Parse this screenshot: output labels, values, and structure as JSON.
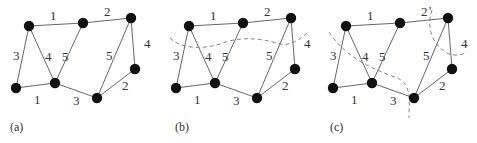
{
  "figure": {
    "panels": [
      {
        "id": "a",
        "label": "(a)",
        "cuts": []
      },
      {
        "id": "b",
        "label": "(b)",
        "cuts": [
          "cut-horizontal"
        ]
      },
      {
        "id": "c",
        "label": "(c)",
        "cuts": [
          "cut-left-arc",
          "cut-right-arc"
        ]
      }
    ],
    "nodes": [
      "A",
      "B",
      "C",
      "D",
      "E",
      "F",
      "G"
    ],
    "edges": [
      {
        "from": "A",
        "to": "B",
        "weight": "1"
      },
      {
        "from": "B",
        "to": "C",
        "weight": "2"
      },
      {
        "from": "A",
        "to": "D",
        "weight": "3"
      },
      {
        "from": "A",
        "to": "E",
        "weight": "4"
      },
      {
        "from": "B",
        "to": "E",
        "weight": "5"
      },
      {
        "from": "C",
        "to": "F",
        "weight": "5"
      },
      {
        "from": "C",
        "to": "G",
        "weight": "4"
      },
      {
        "from": "D",
        "to": "E",
        "weight": "1"
      },
      {
        "from": "E",
        "to": "F",
        "weight": "3"
      },
      {
        "from": "F",
        "to": "G",
        "weight": "2"
      }
    ],
    "annotations": {
      "c_prime_mark": "'"
    }
  }
}
